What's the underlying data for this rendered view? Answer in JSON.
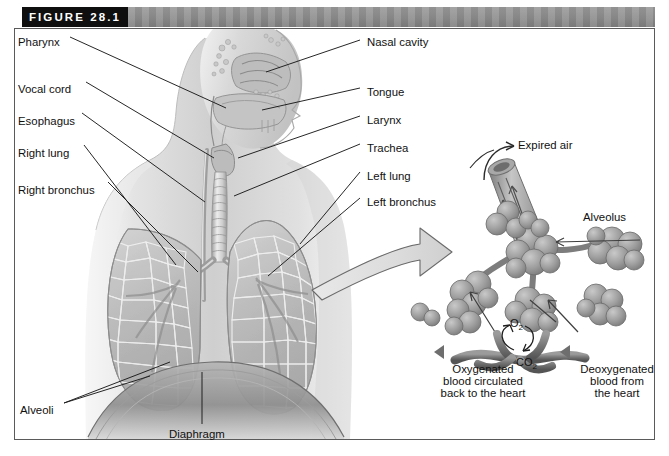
{
  "figure": {
    "number_label": "FIGURE 28.1",
    "bar_black_hex": "#100f0f",
    "bar_gray_hex": "#8d8d8d",
    "frame_border_hex": "#5a5a5a",
    "background_hex": "#ffffff"
  },
  "left_labels": [
    {
      "text": "Pharynx",
      "x": 18,
      "y": 36
    },
    {
      "text": "Vocal cord",
      "x": 18,
      "y": 83
    },
    {
      "text": "Esophagus",
      "x": 18,
      "y": 115
    },
    {
      "text": "Right lung",
      "x": 18,
      "y": 147
    },
    {
      "text": "Right bronchus",
      "x": 18,
      "y": 184
    }
  ],
  "right_labels": [
    {
      "text": "Nasal cavity",
      "x": 367,
      "y": 36
    },
    {
      "text": "Tongue",
      "x": 367,
      "y": 86
    },
    {
      "text": "Larynx",
      "x": 367,
      "y": 114
    },
    {
      "text": "Trachea",
      "x": 367,
      "y": 142
    },
    {
      "text": "Left lung",
      "x": 367,
      "y": 170
    },
    {
      "text": "Left bronchus",
      "x": 367,
      "y": 196
    }
  ],
  "bottom_labels": [
    {
      "text": "Alveoli",
      "x": 20,
      "y": 404
    },
    {
      "text": "Diaphragm",
      "x": 169,
      "y": 428
    }
  ],
  "inset": {
    "expired_air_label": "Expired air",
    "alveolus_label": "Alveolus",
    "oxygen_label": "O",
    "oxygen_sub": "2",
    "carbon_dioxide_label": "CO",
    "carbon_dioxide_sub": "2",
    "left_caption_lines": [
      "Oxygenated",
      "blood circulated",
      "back to the heart"
    ],
    "right_caption_lines": [
      "Deoxygenated",
      "blood from",
      "the heart"
    ]
  },
  "anatomy_parts": [
    "nasal-cavity",
    "tongue",
    "pharynx",
    "larynx",
    "vocal-cord",
    "esophagus",
    "trachea",
    "right-bronchus",
    "left-bronchus",
    "right-lung",
    "left-lung",
    "diaphragm",
    "alveoli",
    "alveolus",
    "pulmonary-capillary",
    "torso"
  ]
}
